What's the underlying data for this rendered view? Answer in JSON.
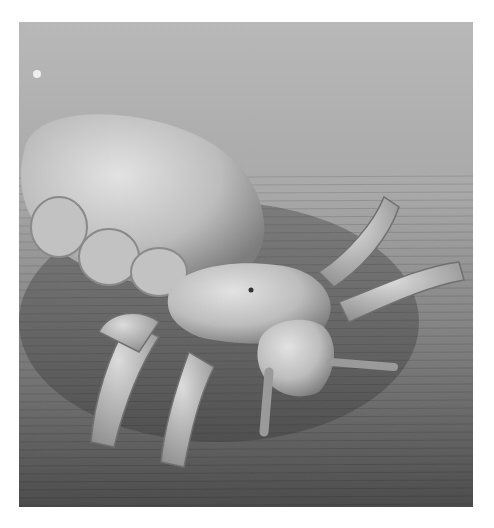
{
  "image": {
    "subject": "head louse",
    "description": "Grayscale scanning electron micrograph of a louse on a textured surface",
    "colors": {
      "background_light": "#b8b8b8",
      "background_dark": "#4c4c4c",
      "body": "#c8c8c8",
      "shadow": "#5a5a5a",
      "page": "#ffffff"
    }
  }
}
